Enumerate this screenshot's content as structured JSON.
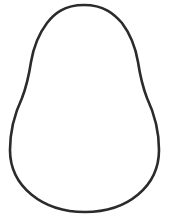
{
  "figure": {
    "width": 171,
    "height": 222,
    "background": "#ffffff",
    "shape": {
      "name": "pear-outline",
      "stroke": "#2b2b2b",
      "stroke_width": 2.6,
      "fill": "none",
      "path": "M 84 5 C 64 5 54 14 47 23 C 38 35 33 50 31 62 C 29 75 27 85 22 98 C 14 115 10 130 10 150 C 10 186 42 212 85 212 C 128 212 159 186 159 150 C 159 130 155 115 147 98 C 142 85 140 75 138 62 C 136 50 131 35 122 23 C 114 14 104 5 84 5 Z"
    }
  }
}
